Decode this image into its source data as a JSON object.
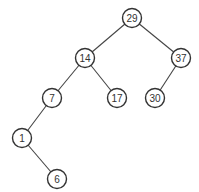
{
  "diagram": {
    "type": "binary-search-tree",
    "node_radius": 9.5,
    "nodes": [
      {
        "id": "n29",
        "label": "29",
        "x": 132,
        "y": 18
      },
      {
        "id": "n14",
        "label": "14",
        "x": 85,
        "y": 58
      },
      {
        "id": "n37",
        "label": "37",
        "x": 181,
        "y": 58
      },
      {
        "id": "n7",
        "label": "7",
        "x": 52,
        "y": 98
      },
      {
        "id": "n17",
        "label": "17",
        "x": 117,
        "y": 98
      },
      {
        "id": "n30",
        "label": "30",
        "x": 155,
        "y": 98
      },
      {
        "id": "n1",
        "label": "1",
        "x": 22,
        "y": 138
      },
      {
        "id": "n6",
        "label": "6",
        "x": 57,
        "y": 179
      }
    ],
    "edges": [
      {
        "from": "n29",
        "to": "n14"
      },
      {
        "from": "n29",
        "to": "n37"
      },
      {
        "from": "n14",
        "to": "n7"
      },
      {
        "from": "n14",
        "to": "n17"
      },
      {
        "from": "n37",
        "to": "n30"
      },
      {
        "from": "n7",
        "to": "n1"
      },
      {
        "from": "n1",
        "to": "n6"
      }
    ]
  }
}
